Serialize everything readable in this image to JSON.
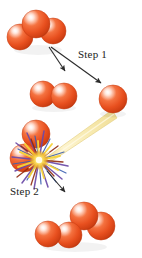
{
  "figure": {
    "type": "diagram",
    "background_color": "#ffffff",
    "width": 142,
    "height": 258
  },
  "labels": {
    "step1": "Step 1",
    "step2": "Step 2"
  },
  "palette": {
    "sphere_core": "#ef5a2b",
    "sphere_mid": "#e24a1d",
    "sphere_shadow": "#b8350f",
    "sphere_highlight": "#ffe7dc",
    "sphere_outline": "#c23c12",
    "beam_fill": "#f7e9a8",
    "beam_edge": "#e8d173",
    "burst_yellow": "#f6d33a",
    "burst_purple": "#6b4aa8",
    "burst_blue": "#3a5fb0",
    "burst_darkred": "#8e2a10",
    "arrow_color": "#2b2b2b",
    "text_color": "#1d1c1a"
  },
  "molecules": [
    {
      "id": "reactant-top",
      "name": "triatomic-cluster-top",
      "atom_count": 3,
      "atoms": [
        {
          "cx": 20,
          "cy": 37,
          "r": 13
        },
        {
          "cx": 36,
          "cy": 24,
          "r": 14
        },
        {
          "cx": 53,
          "cy": 31,
          "r": 13
        }
      ]
    },
    {
      "id": "product-diatomic-mid",
      "name": "diatomic-cluster-middle",
      "atom_count": 2,
      "atoms": [
        {
          "cx": 43,
          "cy": 94,
          "r": 13
        },
        {
          "cx": 64,
          "cy": 96,
          "r": 13
        }
      ]
    },
    {
      "id": "product-monatomic",
      "name": "single-atom-right",
      "atom_count": 1,
      "atoms": [
        {
          "cx": 113,
          "cy": 99,
          "r": 14
        }
      ]
    },
    {
      "id": "reactant-collision",
      "name": "diatomic-cluster-colliding",
      "atom_count": 2,
      "atoms": [
        {
          "cx": 36,
          "cy": 134,
          "r": 14
        },
        {
          "cx": 24,
          "cy": 158,
          "r": 14
        }
      ]
    },
    {
      "id": "product-bottom",
      "name": "tetratomic-cluster-bottom",
      "atom_count": 4,
      "atoms": [
        {
          "cx": 48,
          "cy": 234,
          "r": 13
        },
        {
          "cx": 69,
          "cy": 235,
          "r": 13
        },
        {
          "cx": 84,
          "cy": 216,
          "r": 14
        },
        {
          "cx": 101,
          "cy": 226,
          "r": 14
        }
      ]
    }
  ],
  "arrows": [
    {
      "id": "arrow-step1-left",
      "name": "arrow-to-diatomic",
      "from": [
        49,
        48
      ],
      "to": [
        66,
        73
      ]
    },
    {
      "id": "arrow-step1-right",
      "name": "arrow-to-single-atom",
      "from": [
        50,
        48
      ],
      "to": [
        103,
        85
      ]
    },
    {
      "id": "arrow-step2",
      "name": "arrow-to-product",
      "from": [
        47,
        172
      ],
      "to": [
        67,
        194
      ]
    }
  ],
  "beam": {
    "id": "energy-beam",
    "name": "collision-trajectory-beam",
    "color": "#f7e9a8",
    "from": [
      50,
      158
    ],
    "to": [
      113,
      114
    ],
    "width_start": 4,
    "width_end": 11
  },
  "burst": {
    "id": "collision-burst",
    "name": "collision-starburst",
    "center": [
      39,
      160
    ],
    "ray_count": 44,
    "radius_min": 10,
    "radius_max": 30
  }
}
